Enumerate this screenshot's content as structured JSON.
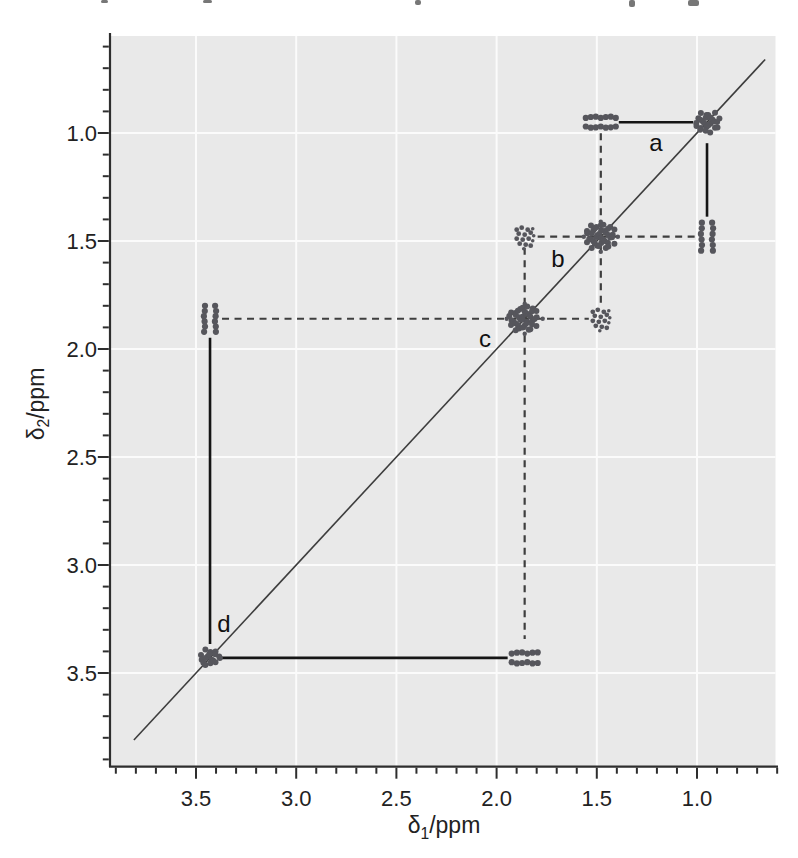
{
  "axes": {
    "x": {
      "delta": "δ",
      "sub": "1",
      "rest": "/ppm",
      "tick_labels": [
        "3.5",
        "3.0",
        "2.5",
        "2.0",
        "1.5",
        "1.0"
      ]
    },
    "y": {
      "delta": "δ",
      "sub": "2",
      "rest": "/ppm",
      "tick_labels": [
        "1.0",
        "1.5",
        "2.0",
        "2.5",
        "3.0",
        "3.5"
      ]
    }
  },
  "chart_data": {
    "type": "scatter",
    "subtype": "2D COSY NMR spectrum",
    "title": "",
    "xlabel": "δ1/ppm",
    "ylabel": "δ2/ppm",
    "x_axis": {
      "range_ppm": [
        3.9,
        0.6
      ],
      "reversed": true,
      "major_ticks": [
        3.5,
        3.0,
        2.5,
        2.0,
        1.5,
        1.0
      ],
      "minor_step": 0.1
    },
    "y_axis": {
      "range_ppm": [
        0.55,
        3.9
      ],
      "increases_downward": true,
      "major_ticks": [
        1.0,
        1.5,
        2.0,
        2.5,
        3.0,
        3.5
      ],
      "minor_step": 0.1
    },
    "grid": true,
    "diagonal_line": true,
    "diagonal_peaks": [
      {
        "ppm": 0.95,
        "extent": [
          24,
          20
        ],
        "flared": false
      },
      {
        "ppm": 1.48,
        "extent": [
          30,
          26
        ],
        "flared": true
      },
      {
        "ppm": 1.86,
        "extent": [
          32,
          26
        ],
        "flared": true
      },
      {
        "ppm": 3.43,
        "extent": [
          20,
          18
        ],
        "flared": false
      }
    ],
    "cross_peaks": [
      {
        "d1": 1.48,
        "d2": 0.95,
        "pattern": "two-horizontal-bars",
        "extent": 30
      },
      {
        "d1": 0.95,
        "d2": 1.48,
        "pattern": "two-vertical-bars",
        "extent": 28
      },
      {
        "d1": 1.86,
        "d2": 1.48,
        "pattern": "dot-cluster",
        "extent": 22
      },
      {
        "d1": 1.48,
        "d2": 1.86,
        "pattern": "dot-cluster",
        "extent": 22
      },
      {
        "d1": 3.43,
        "d2": 1.86,
        "pattern": "two-vertical-bars",
        "extent": 26
      },
      {
        "d1": 1.86,
        "d2": 3.43,
        "pattern": "two-horizontal-bars",
        "extent": 26
      }
    ],
    "correlations": [
      {
        "label": "a",
        "between_ppm": [
          0.95,
          1.48
        ],
        "line_style": "solid"
      },
      {
        "label": "b",
        "between_ppm": [
          1.48,
          1.86
        ],
        "line_style": "dashed"
      },
      {
        "label": "c",
        "between_ppm": [
          1.86,
          3.43
        ],
        "line_style": "dashed"
      },
      {
        "label": "d",
        "between_ppm": [
          3.43,
          1.86
        ],
        "line_style": "solid"
      }
    ],
    "colors": {
      "plot_background": "#e9e9e9",
      "gridline": "#fbfbfb",
      "axis": "#2e2e2e",
      "diagonal": "#3d3d3d",
      "peak": "#56565c",
      "solid_connector": "#151515",
      "dashed_connector": "#3e3e3e"
    }
  }
}
